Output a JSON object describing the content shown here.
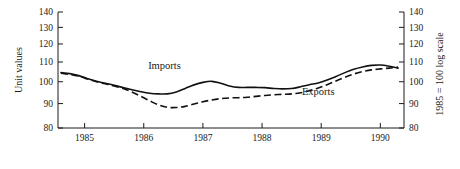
{
  "chart_data": {
    "type": "line",
    "title": "",
    "subtitle": "",
    "xlabel": "",
    "ylabel": "Unit values",
    "ylabel_right": "1985 = 100 log scale",
    "ylim": [
      80,
      140
    ],
    "yticks": [
      80,
      90,
      100,
      110,
      120,
      130,
      140
    ],
    "ytick_labels": [
      "80",
      "90",
      "100",
      "110",
      "120",
      "130",
      "140"
    ],
    "yticks_right": [
      80,
      90,
      100,
      110,
      120,
      130,
      140
    ],
    "ytick_labels_right": [
      "80",
      "90",
      "100",
      "110",
      "120",
      "130",
      "140"
    ],
    "yscale": "log",
    "xlim": [
      1984.55,
      1990.4
    ],
    "xticks": [
      1985,
      1986,
      1987,
      1988,
      1989,
      1990
    ],
    "xtick_labels": [
      "1985",
      "1986",
      "1987",
      "1988",
      "1989",
      "1990"
    ],
    "grid": false,
    "legend": "inline-annotations",
    "annotations": [
      {
        "text": "Imports",
        "x": 1986.35,
        "y": 106.5
      },
      {
        "text": "Exports",
        "x": 1988.95,
        "y": 94.0
      }
    ],
    "series": [
      {
        "name": "Imports",
        "style": "solid",
        "color": "#111111",
        "x": [
          1984.6,
          1984.75,
          1984.9,
          1985.05,
          1985.2,
          1985.35,
          1985.5,
          1985.65,
          1985.8,
          1985.95,
          1986.1,
          1986.25,
          1986.4,
          1986.55,
          1986.7,
          1986.85,
          1987.0,
          1987.15,
          1987.3,
          1987.45,
          1987.6,
          1987.75,
          1987.9,
          1988.05,
          1988.2,
          1988.35,
          1988.5,
          1988.65,
          1988.8,
          1988.95,
          1989.1,
          1989.25,
          1989.4,
          1989.55,
          1989.7,
          1989.85,
          1990.0,
          1990.15,
          1990.3
        ],
        "y": [
          104.5,
          104.0,
          103.0,
          101.5,
          100.2,
          99.3,
          98.3,
          97.3,
          96.2,
          95.3,
          94.6,
          94.3,
          94.3,
          95.2,
          96.8,
          98.5,
          99.7,
          100.2,
          99.3,
          98.0,
          97.3,
          97.3,
          97.3,
          97.2,
          96.8,
          96.6,
          96.8,
          97.6,
          98.6,
          99.4,
          100.8,
          102.6,
          104.5,
          106.2,
          107.4,
          108.2,
          108.4,
          107.8,
          106.8
        ]
      },
      {
        "name": "Exports",
        "style": "dashed",
        "color": "#111111",
        "x": [
          1984.6,
          1984.75,
          1984.9,
          1985.05,
          1985.2,
          1985.35,
          1985.5,
          1985.65,
          1985.8,
          1985.95,
          1986.1,
          1986.25,
          1986.4,
          1986.55,
          1986.7,
          1986.85,
          1987.0,
          1987.15,
          1987.3,
          1987.45,
          1987.6,
          1987.75,
          1987.9,
          1988.05,
          1988.2,
          1988.35,
          1988.5,
          1988.65,
          1988.8,
          1988.95,
          1989.1,
          1989.25,
          1989.4,
          1989.55,
          1989.7,
          1989.85,
          1990.0,
          1990.15,
          1990.3
        ],
        "y": [
          104.2,
          103.6,
          102.7,
          101.3,
          100.0,
          99.0,
          98.0,
          96.8,
          95.2,
          93.2,
          91.2,
          89.4,
          88.4,
          88.3,
          88.8,
          89.8,
          90.8,
          91.6,
          92.2,
          92.5,
          92.6,
          92.8,
          93.2,
          93.6,
          93.9,
          94.1,
          94.3,
          94.8,
          95.8,
          97.0,
          98.6,
          100.4,
          102.2,
          103.8,
          105.0,
          105.9,
          106.4,
          106.8,
          107.3
        ]
      }
    ]
  },
  "axes": {
    "left_axis_name": "left-value-axis",
    "right_axis_name": "right-value-axis",
    "bottom_axis_name": "year-axis"
  }
}
